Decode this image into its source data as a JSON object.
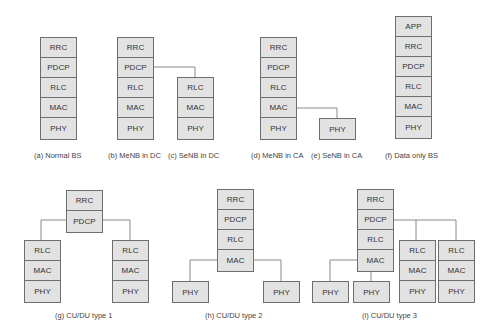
{
  "panels": {
    "a": {
      "caption": "(a) Normal BS",
      "stack": [
        "RRC",
        "PDCP",
        "RLC",
        "MAC",
        "PHY"
      ]
    },
    "b": {
      "caption": "(b) MeNB in DC",
      "stack": [
        "RRC",
        "PDCP",
        "RLC",
        "MAC",
        "PHY"
      ]
    },
    "c": {
      "caption": "(c) SeNB in DC",
      "stack": [
        "RLC",
        "MAC",
        "PHY"
      ]
    },
    "d": {
      "caption": "(d) MeNB in CA",
      "stack": [
        "RRC",
        "PDCP",
        "RLC",
        "MAC",
        "PHY"
      ]
    },
    "e": {
      "caption": "(e) SeNB in CA",
      "stack": [
        "PHY"
      ]
    },
    "f": {
      "caption": "(f) Data only BS",
      "stack": [
        "APP",
        "RRC",
        "PDCP",
        "RLC",
        "MAC",
        "PHY"
      ]
    },
    "g": {
      "caption": "(g) CU/DU type 1",
      "cu": [
        "RRC",
        "PDCP"
      ],
      "du_left": [
        "RLC",
        "MAC",
        "PHY"
      ],
      "du_right": [
        "RLC",
        "MAC",
        "PHY"
      ]
    },
    "h": {
      "caption": "(h) CU/DU type 2",
      "cu": [
        "RRC",
        "PDCP",
        "RLC",
        "MAC"
      ],
      "du_left": [
        "PHY"
      ],
      "du_right": [
        "PHY"
      ]
    },
    "i": {
      "caption": "(i) CU/DU type 3",
      "cu": [
        "RRC",
        "PDCP",
        "RLC",
        "MAC"
      ],
      "phy1": [
        "PHY"
      ],
      "phy2": [
        "PHY"
      ],
      "du1": [
        "RLC",
        "MAC",
        "PHY"
      ],
      "du2": [
        "RLC",
        "MAC",
        "PHY"
      ]
    }
  }
}
